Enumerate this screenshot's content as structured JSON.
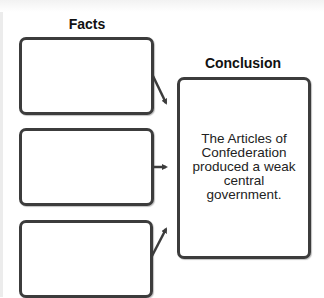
{
  "diagram": {
    "type": "facts-to-conclusion graphic organizer",
    "facts": {
      "heading": "Facts",
      "boxes": [
        {
          "text": ""
        },
        {
          "text": ""
        },
        {
          "text": ""
        }
      ]
    },
    "conclusion": {
      "heading": "Conclusion",
      "text": "The Articles of Confederation produced a weak central government."
    },
    "arrows": [
      {
        "from": "fact-1",
        "to": "conclusion",
        "direction": "down-right"
      },
      {
        "from": "fact-2",
        "to": "conclusion",
        "direction": "right"
      },
      {
        "from": "fact-3",
        "to": "conclusion",
        "direction": "up-right"
      }
    ],
    "colors": {
      "border": "#3c3c3c",
      "text": "#222222",
      "background": "#ffffff"
    }
  }
}
